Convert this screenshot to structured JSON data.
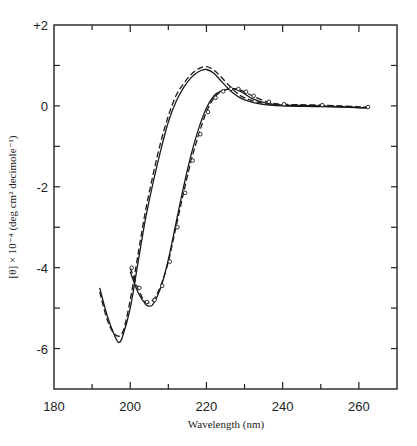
{
  "chart_data": {
    "type": "line",
    "title": "",
    "xlabel": "Wavelength (nm)",
    "ylabel": "[θ] × 10⁻⁴ (deg cm² decimole⁻¹)",
    "xlim": [
      180,
      270
    ],
    "ylim": [
      -7,
      2
    ],
    "x_ticks": [
      180,
      200,
      220,
      240,
      260
    ],
    "x_tick_labels": [
      "180",
      "200",
      "220",
      "240",
      "260"
    ],
    "y_ticks": [
      2,
      0,
      -2,
      -4,
      -6
    ],
    "y_tick_labels": [
      "+2",
      "0",
      "-2",
      "-4",
      "-6"
    ],
    "grid": false,
    "series": [
      {
        "name": "A solid",
        "style": "solid",
        "x": [
          192,
          194,
          196,
          197,
          198,
          200,
          202,
          204,
          206,
          208,
          210,
          212,
          214,
          216,
          218,
          220,
          222,
          224,
          226,
          228,
          230,
          234,
          240,
          250,
          262
        ],
        "y": [
          -4.5,
          -5.2,
          -5.7,
          -5.85,
          -5.7,
          -5.0,
          -3.9,
          -2.8,
          -1.9,
          -1.1,
          -0.4,
          0.1,
          0.45,
          0.7,
          0.85,
          0.9,
          0.8,
          0.6,
          0.4,
          0.25,
          0.15,
          0.05,
          0.0,
          -0.02,
          -0.05
        ]
      },
      {
        "name": "A dashed",
        "style": "dashed",
        "x": [
          192,
          194,
          196,
          198,
          200,
          202,
          204,
          206,
          208,
          210,
          212,
          214,
          216,
          218,
          220,
          222,
          224,
          226,
          228,
          230,
          234,
          240,
          250,
          262
        ],
        "y": [
          -4.6,
          -5.3,
          -5.65,
          -5.6,
          -4.8,
          -3.7,
          -2.6,
          -1.7,
          -0.9,
          -0.25,
          0.25,
          0.55,
          0.78,
          0.92,
          0.97,
          0.88,
          0.7,
          0.5,
          0.32,
          0.2,
          0.08,
          0.02,
          0.0,
          -0.04
        ]
      },
      {
        "name": "B solid",
        "style": "solid",
        "x": [
          200,
          202,
          204,
          205,
          206,
          208,
          210,
          212,
          214,
          216,
          218,
          220,
          222,
          224,
          226,
          227,
          228,
          230,
          232,
          236,
          240,
          250,
          262
        ],
        "y": [
          -4.1,
          -4.6,
          -4.9,
          -4.95,
          -4.9,
          -4.5,
          -3.8,
          -2.9,
          -2.0,
          -1.2,
          -0.55,
          -0.05,
          0.25,
          0.38,
          0.42,
          0.42,
          0.4,
          0.3,
          0.18,
          0.06,
          0.02,
          0.0,
          -0.05
        ]
      },
      {
        "name": "B dashed circles",
        "style": "dashed-circles",
        "x": [
          200,
          202,
          204,
          206,
          208,
          210,
          212,
          214,
          216,
          218,
          220,
          222,
          224,
          226,
          228,
          230,
          232,
          236,
          240,
          250,
          262
        ],
        "y": [
          -4.0,
          -4.5,
          -4.85,
          -4.8,
          -4.45,
          -3.85,
          -3.0,
          -2.15,
          -1.35,
          -0.7,
          -0.15,
          0.2,
          0.36,
          0.42,
          0.42,
          0.35,
          0.25,
          0.1,
          0.04,
          0.02,
          -0.03
        ]
      }
    ]
  },
  "axes": {
    "xlabel": "Wavelength (nm)",
    "ylabel": "[θ] × 10⁻⁴ (deg cm² decimole⁻¹)"
  }
}
